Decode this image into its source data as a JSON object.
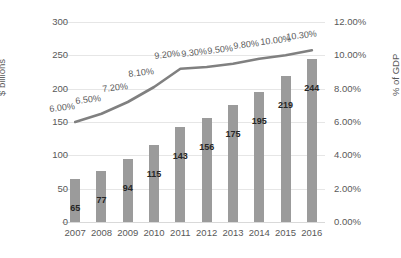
{
  "chart_data": {
    "type": "bar",
    "title": "",
    "subtitle": "",
    "xlabel": "",
    "ylabel": "$ billions",
    "y2label": "% of GDP",
    "grid": true,
    "legend": "none",
    "categories": [
      "2007",
      "2008",
      "2009",
      "2010",
      "2011",
      "2012",
      "2013",
      "2014",
      "2015",
      "2016"
    ],
    "ylim": [
      0,
      300
    ],
    "y2lim": [
      0,
      12
    ],
    "yticks": [
      "0",
      "50",
      "100",
      "150",
      "200",
      "250",
      "300"
    ],
    "ytick_values": [
      0,
      50,
      100,
      150,
      200,
      250,
      300
    ],
    "y2ticks": [
      "0.00%",
      "2.00%",
      "4.00%",
      "6.00%",
      "8.00%",
      "10.00%",
      "12.00%"
    ],
    "y2tick_values": [
      0,
      2,
      4,
      6,
      8,
      10,
      12
    ],
    "series": [
      {
        "name": "$ billions",
        "type": "bar",
        "axis": "left",
        "color": "#9b9b9b",
        "values": [
          65,
          77,
          94,
          115,
          143,
          156,
          175,
          195,
          219,
          244
        ],
        "labels": [
          "65",
          "77",
          "94",
          "115",
          "143",
          "156",
          "175",
          "195",
          "219",
          "244"
        ]
      },
      {
        "name": "% of GDP",
        "type": "line",
        "axis": "right",
        "color": "#808080",
        "values": [
          6.0,
          6.5,
          7.2,
          8.1,
          9.2,
          9.3,
          9.5,
          9.8,
          10.0,
          10.3
        ],
        "labels": [
          "6.00%",
          "6.50%",
          "7.20%",
          "8.10%",
          "9.20%",
          "9.30%",
          "9.50%",
          "9.80%",
          "10.00%",
          "10.30%"
        ]
      }
    ]
  }
}
